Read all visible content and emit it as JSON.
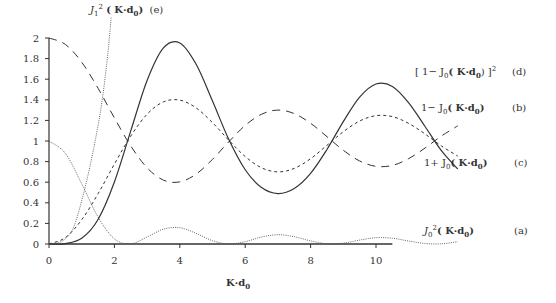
{
  "chart_data": {
    "type": "line",
    "title": "",
    "xlabel": "K·d0",
    "ylabel": "",
    "xlim": [
      0,
      12.6
    ],
    "ylim": [
      0,
      2
    ],
    "xticks": [
      0,
      2,
      4,
      6,
      8,
      10
    ],
    "yticks": [
      0,
      0.2,
      0.4,
      0.6,
      0.8,
      1,
      1.2,
      1.4,
      1.6,
      1.8,
      2
    ],
    "grid": false,
    "x": [
      0,
      0.5,
      1,
      1.5,
      2,
      2.5,
      3,
      3.5,
      4,
      4.5,
      5,
      5.5,
      6,
      6.5,
      7,
      7.5,
      8,
      8.5,
      9,
      9.5,
      10,
      10.5,
      11,
      11.5,
      12,
      12.5
    ],
    "series": [
      {
        "name": "J0^2(K·d0)",
        "id": "a",
        "style": "dotted",
        "values": [
          1,
          0.88,
          0.585,
          0.262,
          0.05,
          0.002,
          0.068,
          0.144,
          0.158,
          0.103,
          0.032,
          0.0,
          0.023,
          0.068,
          0.09,
          0.071,
          0.03,
          0.002,
          0.008,
          0.038,
          0.061,
          0.056,
          0.029,
          0.005,
          0.002,
          0.022
        ]
      },
      {
        "name": "1-J0(K·d0)",
        "id": "b",
        "style": "short-dash",
        "values": [
          0,
          0.062,
          0.235,
          0.488,
          0.776,
          1.048,
          1.26,
          1.38,
          1.397,
          1.321,
          1.178,
          1.007,
          0.849,
          0.74,
          0.7,
          0.734,
          0.828,
          0.958,
          1.09,
          1.194,
          1.246,
          1.237,
          1.171,
          1.068,
          0.952,
          0.853
        ]
      },
      {
        "name": "1+J0(K·d0)",
        "id": "c",
        "style": "long-dash",
        "values": [
          2,
          1.938,
          1.765,
          1.512,
          1.224,
          0.952,
          0.74,
          0.62,
          0.603,
          0.679,
          0.822,
          0.993,
          1.151,
          1.26,
          1.3,
          1.266,
          1.172,
          1.042,
          0.91,
          0.806,
          0.754,
          0.763,
          0.829,
          0.932,
          1.048,
          1.147
        ]
      },
      {
        "name": "[1-J0(K·d0)]^2",
        "id": "d",
        "style": "solid",
        "values": [
          0,
          0.004,
          0.055,
          0.238,
          0.602,
          1.098,
          1.588,
          1.904,
          1.952,
          1.745,
          1.388,
          1.014,
          0.721,
          0.548,
          0.49,
          0.539,
          0.686,
          0.918,
          1.188,
          1.426,
          1.553,
          1.53,
          1.371,
          1.141,
          0.906,
          0.728
        ]
      },
      {
        "name": "J1^2(K·d0)",
        "id": "e",
        "style": "dotted",
        "x": [
          0,
          0.25,
          0.5,
          0.75,
          1.0,
          1.25,
          1.5,
          1.65,
          1.8,
          1.9
        ],
        "values": [
          0,
          0.01,
          0.05,
          0.16,
          0.42,
          0.75,
          1.15,
          1.45,
          1.85,
          2.2
        ]
      }
    ],
    "annotations": [
      {
        "text": "J1²(K·d0)",
        "tag": "(e)"
      },
      {
        "text": "[1−J0(K·d0)]²",
        "tag": "(d)"
      },
      {
        "text": "1−J0(K·d0)",
        "tag": "(b)"
      },
      {
        "text": "1+J0(K·d0)",
        "tag": "(c)"
      },
      {
        "text": "J0²(K·d0)",
        "tag": "(a)"
      }
    ]
  },
  "labels": {
    "xlabel_main": "K·d",
    "xlabel_sub": "0",
    "e": {
      "J": "J",
      "sub": "1",
      "sup": "2",
      "arg": "( K·d",
      "argsub": "0",
      "close": ")",
      "tag": "(e)"
    },
    "d": {
      "pre": "[ 1− J",
      "sub": "0",
      "arg": "( K·d",
      "argsub": "0",
      "close": ") ]",
      "sup": "2",
      "tag": "(d)"
    },
    "b": {
      "pre": "1− J",
      "sub": "0",
      "arg": "( K·d",
      "argsub": "0",
      "close": ")",
      "tag": "(b)"
    },
    "c": {
      "pre": "1+ J",
      "sub": "0",
      "arg": "( K·d",
      "argsub": "0",
      "close": ")",
      "tag": "(c)"
    },
    "a": {
      "J": "J",
      "sub": "0",
      "sup": "2",
      "arg": "( K·d",
      "argsub": "0",
      "close": ")",
      "tag": "(a)"
    }
  }
}
